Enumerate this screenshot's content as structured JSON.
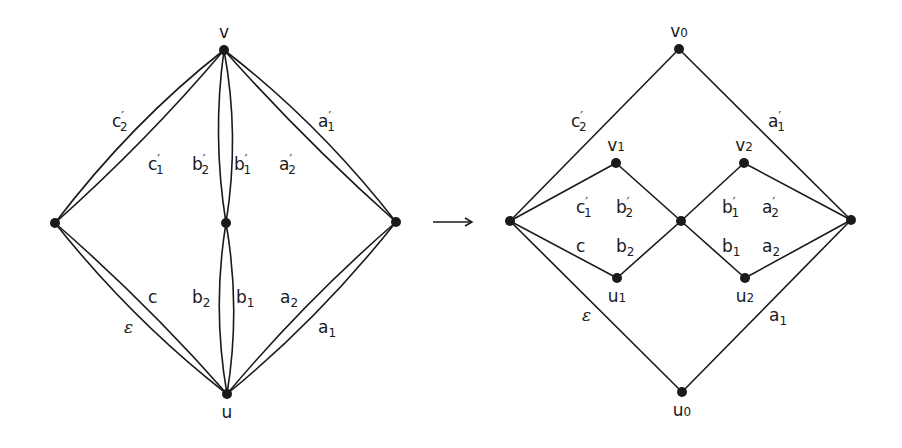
{
  "diagram": {
    "left_graph": {
      "vertices": {
        "v": {
          "label": "v",
          "x": 224,
          "y": 50
        },
        "u": {
          "label": "u",
          "x": 227,
          "y": 394
        },
        "left": {
          "label": "",
          "x": 55,
          "y": 223
        },
        "right": {
          "label": "",
          "x": 396,
          "y": 222
        },
        "middle": {
          "label": "",
          "x": 226,
          "y": 223
        }
      },
      "edge_labels": [
        {
          "base": "c",
          "prime": "′",
          "sub": "2",
          "x": 112,
          "y": 127
        },
        {
          "base": "c",
          "prime": "′",
          "sub": "1",
          "x": 148,
          "y": 170
        },
        {
          "base": "b",
          "prime": "′",
          "sub": "2",
          "x": 192,
          "y": 170
        },
        {
          "base": "b",
          "prime": "′",
          "sub": "1",
          "x": 234,
          "y": 170
        },
        {
          "base": "a",
          "prime": "′",
          "sub": "2",
          "x": 279,
          "y": 170
        },
        {
          "base": "a",
          "prime": "′",
          "sub": "1",
          "x": 318,
          "y": 127
        },
        {
          "base": "c",
          "prime": "",
          "sub": "",
          "x": 148,
          "y": 303
        },
        {
          "base": "ε",
          "prime": "",
          "sub": "",
          "x": 124,
          "y": 333
        },
        {
          "base": "b",
          "prime": "",
          "sub": "2",
          "x": 192,
          "y": 303
        },
        {
          "base": "b",
          "prime": "",
          "sub": "1",
          "x": 236,
          "y": 303
        },
        {
          "base": "a",
          "prime": "",
          "sub": "2",
          "x": 280,
          "y": 303
        },
        {
          "base": "a",
          "prime": "",
          "sub": "1",
          "x": 318,
          "y": 333
        }
      ]
    },
    "arrow": {
      "symbol": "→",
      "x1": 433,
      "x2": 472,
      "y": 222
    },
    "right_graph": {
      "vertices": {
        "v0": {
          "label": "v",
          "sub": "0",
          "x": 679,
          "y": 49
        },
        "u0": {
          "label": "u",
          "sub": "0",
          "x": 682,
          "y": 392
        },
        "v1": {
          "label": "v",
          "sub": "1",
          "x": 616,
          "y": 163
        },
        "v2": {
          "label": "v",
          "sub": "2",
          "x": 744,
          "y": 163
        },
        "u1": {
          "label": "u",
          "sub": "1",
          "x": 617,
          "y": 278
        },
        "u2": {
          "label": "u",
          "sub": "2",
          "x": 745,
          "y": 278
        },
        "left": {
          "label": "",
          "sub": "",
          "x": 510,
          "y": 221
        },
        "right": {
          "label": "",
          "sub": "",
          "x": 851,
          "y": 220
        },
        "middle": {
          "label": "",
          "sub": "",
          "x": 681,
          "y": 221
        }
      },
      "edge_labels": [
        {
          "base": "c",
          "prime": "′",
          "sub": "2",
          "x": 571,
          "y": 127
        },
        {
          "base": "a",
          "prime": "′",
          "sub": "1",
          "x": 768,
          "y": 127
        },
        {
          "base": "c",
          "prime": "′",
          "sub": "1",
          "x": 576,
          "y": 213
        },
        {
          "base": "b",
          "prime": "′",
          "sub": "2",
          "x": 616,
          "y": 213
        },
        {
          "base": "b",
          "prime": "′",
          "sub": "1",
          "x": 722,
          "y": 213
        },
        {
          "base": "a",
          "prime": "′",
          "sub": "2",
          "x": 762,
          "y": 213
        },
        {
          "base": "c",
          "prime": "",
          "sub": "",
          "x": 576,
          "y": 252
        },
        {
          "base": "b",
          "prime": "",
          "sub": "2",
          "x": 616,
          "y": 252
        },
        {
          "base": "b",
          "prime": "",
          "sub": "1",
          "x": 722,
          "y": 252
        },
        {
          "base": "a",
          "prime": "",
          "sub": "2",
          "x": 762,
          "y": 252
        },
        {
          "base": "ε",
          "prime": "",
          "sub": "",
          "x": 582,
          "y": 321
        },
        {
          "base": "a",
          "prime": "",
          "sub": "1",
          "x": 769,
          "y": 321
        }
      ]
    },
    "colors": {
      "ink": "#1a1a1a",
      "background": "#ffffff"
    }
  }
}
